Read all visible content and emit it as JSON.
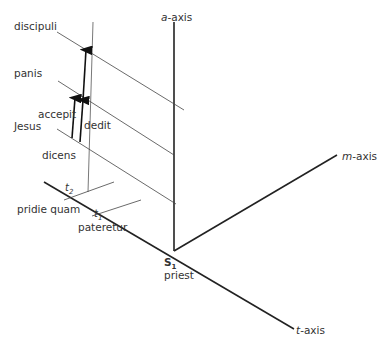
{
  "axes": {
    "a": {
      "italic": "a",
      "suffix": "-axis"
    },
    "m": {
      "italic": "m",
      "suffix": "-axis"
    },
    "t": {
      "italic": "t",
      "suffix": "-axis"
    }
  },
  "origin": {
    "symbol": "S",
    "subscript": "1",
    "label": "priest"
  },
  "participants": [
    "discipuli",
    "panis",
    "Jesus",
    "dicens"
  ],
  "events": [
    {
      "label": "accepit"
    },
    {
      "label": "dedit"
    }
  ],
  "times": [
    {
      "symbol": "t",
      "subscript": "2",
      "label": "pridie quam"
    },
    {
      "symbol": "t",
      "subscript": "1",
      "label": "pateretur"
    }
  ],
  "colors": {
    "line": "#222222",
    "text": "#333333",
    "background": "#ffffff"
  }
}
